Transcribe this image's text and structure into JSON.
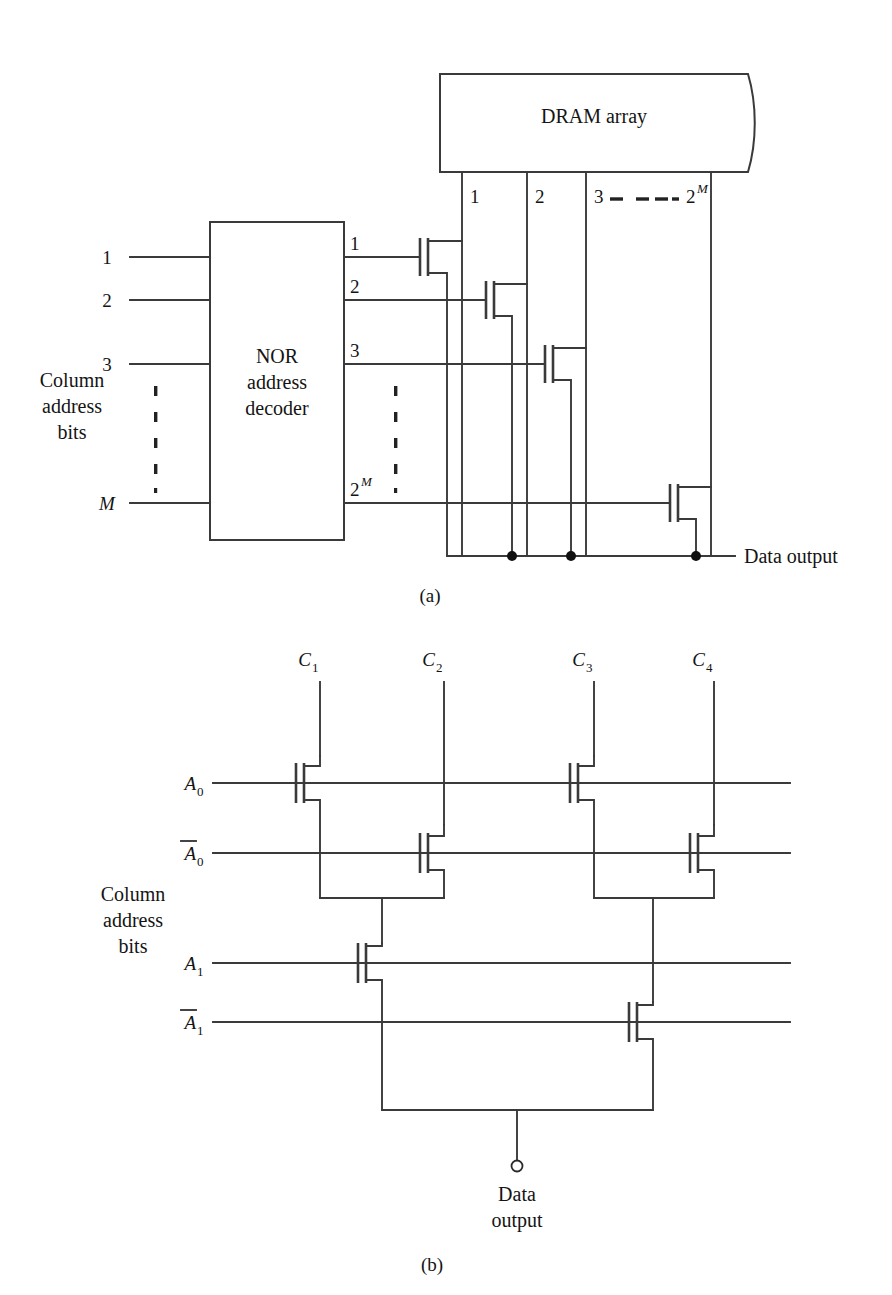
{
  "figure": {
    "type": "circuit-diagram",
    "captions": {
      "a": "(a)",
      "b": "(b)"
    },
    "colors": {
      "line": "#3a3a3a",
      "text": "#141414",
      "background": "#ffffff",
      "node_dot": "#111111"
    }
  },
  "panel_a": {
    "caption": "(a)",
    "array_block": {
      "label": "DRAM array"
    },
    "decoder_block": {
      "line1": "NOR",
      "line2": "address",
      "line3": "decoder"
    },
    "input_side_label": {
      "line1": "Column",
      "line2": "address",
      "line3": "bits"
    },
    "inputs": [
      {
        "label": "1"
      },
      {
        "label": "2"
      },
      {
        "label": "3"
      },
      {
        "label": "M",
        "italic": true
      }
    ],
    "input_ellipsis": "vertical-dots",
    "outputs": [
      {
        "label": "1"
      },
      {
        "label": "2"
      },
      {
        "label": "3"
      },
      {
        "label": "2",
        "exponent": "M"
      }
    ],
    "output_ellipsis": "vertical-dots",
    "columns": [
      {
        "label": "1"
      },
      {
        "label": "2"
      },
      {
        "label": "3"
      },
      {
        "label": "2",
        "exponent": "M"
      }
    ],
    "column_ellipsis": "horizontal-dashes",
    "transistor_count": 4,
    "output_node": {
      "label": "Data output",
      "junction_dots": 3
    }
  },
  "panel_b": {
    "caption": "(b)",
    "side_label": {
      "line1": "Column",
      "line2": "address",
      "line3": "bits"
    },
    "column_inputs": [
      {
        "base": "C",
        "sub": "1"
      },
      {
        "base": "C",
        "sub": "2"
      },
      {
        "base": "C",
        "sub": "3"
      },
      {
        "base": "C",
        "sub": "4"
      }
    ],
    "address_rows": [
      {
        "base": "A",
        "sub": "0",
        "bar": false
      },
      {
        "base": "A",
        "sub": "0",
        "bar": true
      },
      {
        "base": "A",
        "sub": "1",
        "bar": false
      },
      {
        "base": "A",
        "sub": "1",
        "bar": true
      }
    ],
    "transistor_count": 6,
    "output_terminal": {
      "line1": "Data",
      "line2": "output",
      "symbol": "open-circle"
    }
  }
}
